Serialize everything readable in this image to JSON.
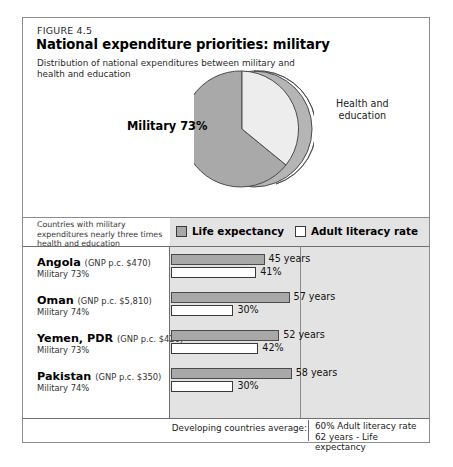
{
  "figure": {
    "number": "FIGURE 4.5",
    "title": "National expenditure priorities: military",
    "subtitle": "Distribution of national expenditures between\nmilitary and health and education"
  },
  "pie": {
    "military_label": "Military 73%",
    "health_label": "Health and\neducation",
    "colors": {
      "military": "#a9a9a9",
      "health": "#ededed",
      "side": "#b5b5b5",
      "outline": "#4a4a4a"
    }
  },
  "table": {
    "caption": "Countries with military\nexpenditures nearly three times\nhealth and education",
    "legend": [
      {
        "label": "Life expectancy",
        "style": "filled"
      },
      {
        "label": "Adult literacy rate",
        "style": "hollow"
      }
    ],
    "rows": [
      {
        "country": "Angola",
        "gnp": "(GNP p.c. $470)",
        "military": "Military  73%",
        "life_label": "45 years",
        "life_value": 45,
        "literacy_label": "41%",
        "literacy_value": 41
      },
      {
        "country": "Oman",
        "gnp": "(GNP p.c. $5,810)",
        "military": "Military  74%",
        "life_label": "57 years",
        "life_value": 57,
        "literacy_label": "30%",
        "literacy_value": 30
      },
      {
        "country": "Yemen, PDR",
        "gnp": "(GNP p.c. $420)",
        "military": "Military  73%",
        "life_label": "52 years",
        "life_value": 52,
        "literacy_label": "42%",
        "literacy_value": 42
      },
      {
        "country": "Pakistan",
        "gnp": "(GNP p.c. $350)",
        "military": "Military  74%",
        "life_label": "58 years",
        "life_value": 58,
        "literacy_label": "30%",
        "literacy_value": 30
      }
    ],
    "footer": {
      "label": "Developing countries average:",
      "values": "60% Adult literacy rate\n62 years - Life expectancy"
    }
  },
  "chart_data": [
    {
      "type": "pie",
      "title": "National expenditure priorities: military",
      "subtitle": "Distribution of national expenditures between military and health and education",
      "categories": [
        "Military",
        "Health and education"
      ],
      "values": [
        73,
        27
      ],
      "labels": [
        "Military 73%",
        "Health and education"
      ],
      "legend": "none",
      "grid": false
    },
    {
      "type": "bar",
      "orientation": "horizontal",
      "title": "Countries with military expenditures nearly three times health and education",
      "categories": [
        "Angola",
        "Oman",
        "Yemen, PDR",
        "Pakistan"
      ],
      "series": [
        {
          "name": "Life expectancy",
          "unit": "years",
          "values": [
            45,
            57,
            52,
            58
          ]
        },
        {
          "name": "Adult literacy rate",
          "unit": "%",
          "values": [
            41,
            30,
            42,
            30
          ]
        }
      ],
      "annotations": [
        "Angola (GNP p.c. $470) Military 73%",
        "Oman (GNP p.c. $5,810) Military 74%",
        "Yemen, PDR (GNP p.c. $420) Military 73%",
        "Pakistan (GNP p.c. $350) Military 74%"
      ],
      "reference_lines": [
        {
          "name": "Developing countries average adult literacy rate",
          "value": 60
        },
        {
          "name": "Developing countries average life expectancy",
          "value": 62
        }
      ],
      "xlabel": "",
      "ylabel": "",
      "xlim": [
        0,
        80
      ],
      "grid": false,
      "legend": "top"
    }
  ]
}
